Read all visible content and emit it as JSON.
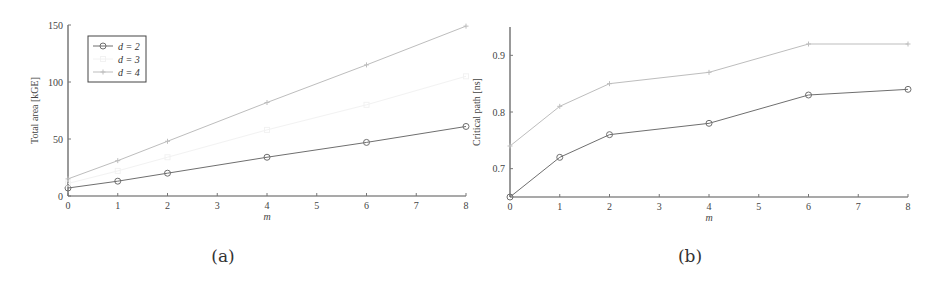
{
  "chart_data": [
    {
      "type": "line",
      "caption": "(a)",
      "title": "",
      "xlabel": "m",
      "ylabel": "Total area [kGE]",
      "xlim": [
        0,
        8
      ],
      "ylim": [
        0,
        150
      ],
      "xticks": [
        "0",
        "1",
        "2",
        "3",
        "4",
        "5",
        "6",
        "7",
        "8"
      ],
      "yticks": [
        "0",
        "50",
        "100",
        "150"
      ],
      "grid": false,
      "legend_position": "upper left",
      "x": [
        0,
        1,
        2,
        4,
        6,
        8
      ],
      "series": [
        {
          "name": "d = 2",
          "marker": "circle",
          "color": "#6f6f6f",
          "values": [
            7,
            13,
            20,
            34,
            47,
            61
          ]
        },
        {
          "name": "d = 3",
          "marker": "square",
          "color": "#f2f2f2",
          "values": [
            11,
            22,
            34,
            58,
            80,
            105
          ]
        },
        {
          "name": "d = 4",
          "marker": "star",
          "color": "#bdbdbd",
          "values": [
            15,
            31,
            48,
            82,
            115,
            149
          ]
        }
      ]
    },
    {
      "type": "line",
      "caption": "(b)",
      "title": "",
      "xlabel": "m",
      "ylabel": "Critical path [ns]",
      "xlim": [
        0,
        8
      ],
      "ylim": [
        0.65,
        0.95
      ],
      "xticks": [
        "0",
        "1",
        "2",
        "3",
        "4",
        "5",
        "6",
        "7",
        "8"
      ],
      "yticks": [
        "0.7",
        "0.8",
        "0.9"
      ],
      "grid": false,
      "x": [
        0,
        1,
        2,
        4,
        6,
        8
      ],
      "series": [
        {
          "name": "d = 2",
          "marker": "circle",
          "color": "#6f6f6f",
          "values": [
            0.65,
            0.72,
            0.76,
            0.78,
            0.83,
            0.84
          ]
        },
        {
          "name": "d = 4",
          "marker": "star",
          "color": "#bdbdbd",
          "values": [
            0.74,
            0.81,
            0.85,
            0.87,
            0.92,
            0.92
          ]
        }
      ]
    }
  ],
  "figure": {
    "a": {
      "caption": "(a)",
      "xlabel": "m",
      "ylabel": "Total area [kGE]",
      "legend": [
        "d = 2",
        "d = 3",
        "d = 4"
      ]
    },
    "b": {
      "caption": "(b)",
      "xlabel": "m",
      "ylabel": "Critical path [ns]"
    }
  }
}
